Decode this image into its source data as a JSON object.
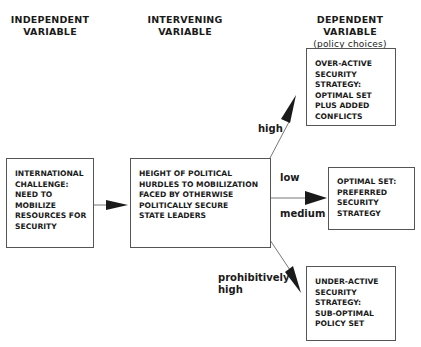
{
  "headers": {
    "independent": [
      "INDEPENDENT",
      "VARIABLE"
    ],
    "intervening": [
      "INTERVENING",
      "VARIABLE"
    ],
    "dependent": [
      "DEPENDENT VARIABLE",
      "(policy choices)"
    ]
  },
  "boxes": {
    "independent": [
      "INTERNATIONAL",
      "CHALLENGE:",
      "NEED TO",
      "MOBILIZE",
      "RESOURCES FOR",
      "SECURITY"
    ],
    "intervening": [
      "HEIGHT OF POLITICAL",
      "HURDLES TO MOBILIZATION",
      "FACED BY OTHERWISE",
      "POLITICALLY SECURE",
      "STATE LEADERS"
    ],
    "over_active": [
      "OVER-ACTIVE",
      "SECURITY",
      "STRATEGY:",
      "OPTIMAL SET",
      "PLUS ADDED",
      "CONFLICTS"
    ],
    "optimal": [
      "OPTIMAL SET:",
      "PREFERRED",
      "SECURITY",
      "STRATEGY"
    ],
    "under_active": [
      "UNDER-ACTIVE",
      "SECURITY",
      "STRATEGY:",
      "SUB-OPTIMAL",
      "POLICY SET"
    ]
  },
  "edge_labels": {
    "high": "high",
    "low": "low",
    "medium": "medium",
    "prohibitively_high": [
      "prohibitively",
      "high"
    ]
  },
  "colors": {
    "line": "#777777",
    "arrowhead": "#1a1a1a",
    "border": "#555555"
  }
}
